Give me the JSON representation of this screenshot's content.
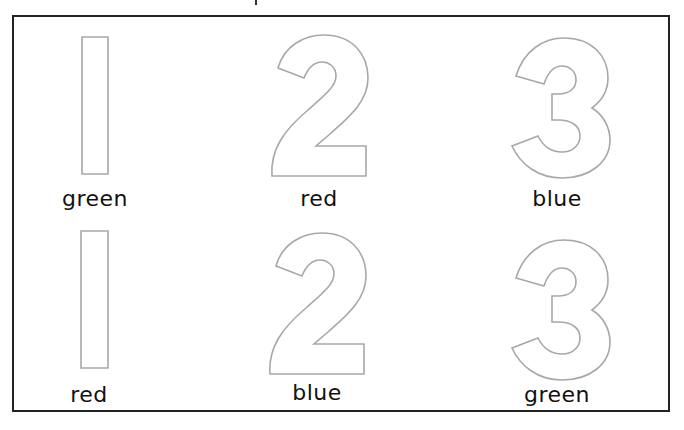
{
  "worksheet": {
    "rows": [
      {
        "items": [
          {
            "numeral": "1",
            "color_word": "green"
          },
          {
            "numeral": "2",
            "color_word": "red"
          },
          {
            "numeral": "3",
            "color_word": "blue"
          }
        ]
      },
      {
        "items": [
          {
            "numeral": "1",
            "color_word": "red"
          },
          {
            "numeral": "2",
            "color_word": "blue"
          },
          {
            "numeral": "3",
            "color_word": "green"
          }
        ]
      }
    ],
    "outline_color": "#a8a8a8",
    "border_color": "#222222"
  }
}
